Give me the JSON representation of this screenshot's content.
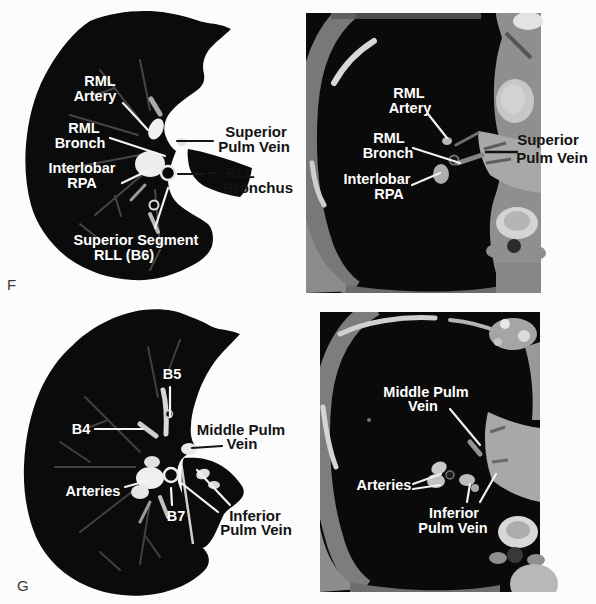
{
  "figure": {
    "panel_f": {
      "letter": "F",
      "lung_window": {
        "labels": {
          "rml_artery": {
            "line1": "RML",
            "line2": "Artery"
          },
          "rml_bronch": {
            "line1": "RML",
            "line2": "Bronch"
          },
          "interlobar_rpa": {
            "line1": "Interlobar",
            "line2": "RPA"
          },
          "superior_pulm_vein": {
            "line1": "Superior",
            "line2": "Pulm Vein"
          },
          "rll_bronchus": {
            "line1": "RLL",
            "line2": "Bronchus"
          },
          "superior_segment": {
            "line1": "Superior Segment",
            "line2": "RLL (B6)"
          }
        }
      },
      "soft_tissue_window": {
        "labels": {
          "rml_artery": {
            "line1": "RML",
            "line2": "Artery"
          },
          "rml_bronch": {
            "line1": "RML",
            "line2": "Bronch"
          },
          "interlobar_rpa": {
            "line1": "Interlobar",
            "line2": "RPA"
          },
          "superior_pulm_vein": {
            "line1": "Superior",
            "line2": "Pulm Vein"
          }
        }
      }
    },
    "panel_g": {
      "letter": "G",
      "lung_window": {
        "labels": {
          "b5": "B5",
          "b4": "B4",
          "middle_pulm_vein": {
            "line1": "Middle Pulm",
            "line2": "Vein"
          },
          "arteries": "Arteries",
          "b7": "B7",
          "inferior_pulm_vein": {
            "line1": "Inferior",
            "line2": "Pulm Vein"
          }
        }
      },
      "soft_tissue_window": {
        "labels": {
          "middle_pulm_vein": {
            "line1": "Middle Pulm",
            "line2": "Vein"
          },
          "arteries": "Arteries",
          "inferior_pulm_vein": {
            "line1": "Inferior",
            "line2": "Pulm Vein"
          }
        }
      }
    },
    "colors": {
      "page_background": "#fcfcfc",
      "lung_black": "#0b0b0b",
      "label_white": "#ffffff",
      "label_black": "#131313",
      "ct_soft_tissue_gray": "#a0a0a0",
      "bone_white": "#d8d8d8"
    }
  }
}
